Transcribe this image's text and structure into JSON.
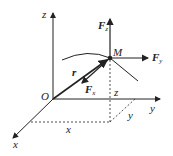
{
  "diagram": {
    "axes": {
      "x_label": "x",
      "y_label": "y",
      "z_label": "z",
      "origin_label": "O"
    },
    "point": {
      "label": "M"
    },
    "position_vector": {
      "label": "r"
    },
    "forces": {
      "fx": {
        "label": "F",
        "sub": "x"
      },
      "fy": {
        "label": "F",
        "sub": "y"
      },
      "fz": {
        "label": "F",
        "sub": "z"
      }
    },
    "projections": {
      "x_label": "x",
      "y_label": "y",
      "z_label": "z"
    },
    "colors": {
      "stroke": "#222222",
      "background": "#ffffff"
    }
  }
}
